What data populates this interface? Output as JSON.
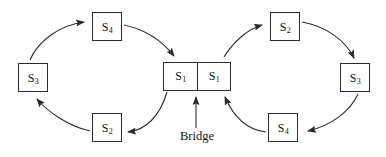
{
  "figure": {
    "type": "state-transition-diagram",
    "background_color": "#ffffff",
    "stroke_color": "#2b2b2b",
    "text_color": "#141414",
    "caption": "Bridge"
  },
  "nodes": {
    "left_cycle": [
      {
        "id": "left-s1",
        "label_base": "S",
        "label_sub": "1",
        "x": 163,
        "y": 62,
        "w": 33,
        "h": 29
      },
      {
        "id": "left-s2",
        "label_base": "S",
        "label_sub": "2",
        "x": 92,
        "y": 113,
        "w": 30,
        "h": 29
      },
      {
        "id": "left-s3",
        "label_base": "S",
        "label_sub": "3",
        "x": 18,
        "y": 63,
        "w": 30,
        "h": 29
      },
      {
        "id": "left-s4",
        "label_base": "S",
        "label_sub": "4",
        "x": 92,
        "y": 12,
        "w": 30,
        "h": 29
      }
    ],
    "right_cycle": [
      {
        "id": "right-s1",
        "label_base": "S",
        "label_sub": "1",
        "x": 196,
        "y": 62,
        "w": 33,
        "h": 29
      },
      {
        "id": "right-s2",
        "label_base": "S",
        "label_sub": "2",
        "x": 270,
        "y": 12,
        "w": 30,
        "h": 29
      },
      {
        "id": "right-s3",
        "label_base": "S",
        "label_sub": "3",
        "x": 340,
        "y": 63,
        "w": 30,
        "h": 29
      },
      {
        "id": "right-s4",
        "label_base": "S",
        "label_sub": "4",
        "x": 268,
        "y": 113,
        "w": 30,
        "h": 29
      }
    ]
  },
  "edges": {
    "left_cycle_order": [
      "left-s1",
      "left-s2",
      "left-s3",
      "left-s4",
      "left-s1"
    ],
    "left_cycle_direction": "counter-clockwise",
    "right_cycle_order": [
      "right-s1",
      "right-s2",
      "right-s3",
      "right-s4",
      "right-s1"
    ],
    "right_cycle_direction": "clockwise",
    "bridge_arrow": {
      "from_label": "Bridge",
      "points_to": "divider between left-s1 and right-s1"
    }
  },
  "labels": {
    "bridge": "Bridge",
    "left_s1": "S1",
    "left_s2": "S2",
    "left_s3": "S3",
    "left_s4": "S4",
    "right_s1": "S1",
    "right_s2": "S2",
    "right_s3": "S3",
    "right_s4": "S4"
  }
}
